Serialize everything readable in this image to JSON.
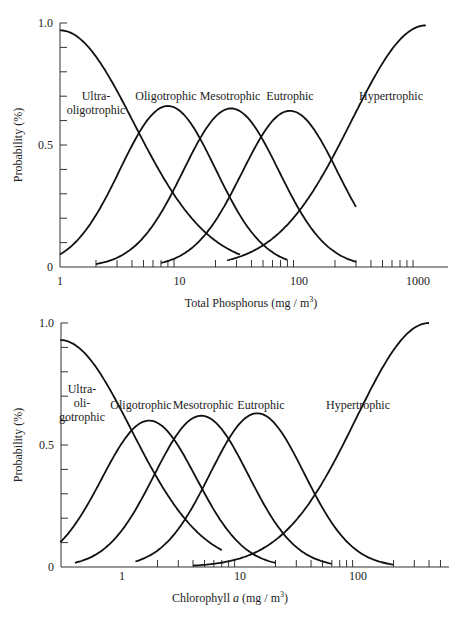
{
  "chart_data": [
    {
      "type": "line",
      "title": "",
      "xlabel": "Total Phosphorus (mg / m",
      "xlabel_sup": "3",
      "xlabel_end": ")",
      "ylabel": "Probability (%)",
      "xscale": "log",
      "xlim": [
        1,
        1800
      ],
      "ylim": [
        0,
        1.0
      ],
      "x_ticks": [
        "1",
        "10",
        "100",
        "1000"
      ],
      "y_ticks": [
        "0",
        "0.5",
        "1.0"
      ],
      "grid": false,
      "series": [
        {
          "name": "Ultra-oligotrophic",
          "label_lines": [
            "Ultra-",
            "oligotrophic"
          ],
          "kind": "left-tail",
          "center": 1.0,
          "peak": 0.97,
          "width": 0.62,
          "x_end": 32
        },
        {
          "name": "Oligotrophic",
          "label_lines": [
            "Oligotrophic"
          ],
          "kind": "gauss",
          "center": 8,
          "peak": 0.66,
          "width": 0.4,
          "x_start": 1,
          "x_end": 80
        },
        {
          "name": "Mesotrophic",
          "label_lines": [
            "Mesotrophic"
          ],
          "kind": "gauss",
          "center": 27,
          "peak": 0.65,
          "width": 0.4,
          "x_start": 2,
          "x_end": 300
        },
        {
          "name": "Eutrophic",
          "label_lines": [
            "Eutrophic"
          ],
          "kind": "gauss",
          "center": 84,
          "peak": 0.64,
          "width": 0.4,
          "x_start": 7,
          "x_end": 300
        },
        {
          "name": "Hypertrophic",
          "label_lines": [
            "Hypertrophic"
          ],
          "kind": "right-tail",
          "center": 1150,
          "peak": 0.99,
          "width": 0.62,
          "x_start": 25,
          "x_end": 1150
        }
      ],
      "approx_points": {
        "Ultra-oligotrophic": [
          [
            1,
            0.97
          ],
          [
            3,
            0.78
          ],
          [
            5,
            0.5
          ],
          [
            10,
            0.15
          ],
          [
            20,
            0.02
          ]
        ],
        "Oligotrophic": [
          [
            1,
            0.03
          ],
          [
            4,
            0.4
          ],
          [
            8,
            0.66
          ],
          [
            15,
            0.4
          ],
          [
            40,
            0.02
          ]
        ],
        "Mesotrophic": [
          [
            4,
            0.03
          ],
          [
            14,
            0.4
          ],
          [
            27,
            0.65
          ],
          [
            50,
            0.4
          ],
          [
            150,
            0.02
          ]
        ],
        "Eutrophic": [
          [
            12,
            0.03
          ],
          [
            45,
            0.4
          ],
          [
            84,
            0.64
          ],
          [
            160,
            0.4
          ],
          [
            300,
            0.03
          ]
        ],
        "Hypertrophic": [
          [
            50,
            0.03
          ],
          [
            150,
            0.5
          ],
          [
            300,
            0.78
          ],
          [
            1150,
            0.99
          ]
        ]
      }
    },
    {
      "type": "line",
      "title": "",
      "xlabel": "Chlorophyll ",
      "xlabel_italic": "a",
      "xlabel_rest": " (mg / m",
      "xlabel_sup": "3",
      "xlabel_end": ")",
      "ylabel": "Probability (%)",
      "xscale": "log",
      "xlim": [
        0.3,
        620
      ],
      "ylim": [
        0,
        1.0
      ],
      "x_ticks": [
        "1",
        "10",
        "100"
      ],
      "y_ticks": [
        "0",
        "0.5",
        "1.0"
      ],
      "grid": false,
      "series": [
        {
          "name": "Ultra-oligotrophic",
          "label_lines": [
            "Ultra-",
            "oli-",
            "gotrophic"
          ],
          "kind": "left-tail",
          "center": 0.3,
          "peak": 0.93,
          "width": 0.6,
          "x_end": 7
        },
        {
          "name": "Oligotrophic",
          "label_lines": [
            "Oligotrophic"
          ],
          "kind": "gauss",
          "center": 1.7,
          "peak": 0.6,
          "width": 0.4,
          "x_start": 0.3,
          "x_end": 20
        },
        {
          "name": "Mesotrophic",
          "label_lines": [
            "Mesotrophic"
          ],
          "kind": "gauss",
          "center": 4.7,
          "peak": 0.62,
          "width": 0.4,
          "x_start": 0.4,
          "x_end": 60
        },
        {
          "name": "Eutrophic",
          "label_lines": [
            "Eutrophic"
          ],
          "kind": "gauss",
          "center": 14,
          "peak": 0.63,
          "width": 0.4,
          "x_start": 1.3,
          "x_end": 200
        },
        {
          "name": "Hypertrophic",
          "label_lines": [
            "Hypertrophic"
          ],
          "kind": "right-tail",
          "center": 400,
          "peak": 1.0,
          "width": 0.62,
          "x_start": 4,
          "x_end": 400
        }
      ],
      "approx_points": {
        "Ultra-oligotrophic": [
          [
            0.3,
            0.93
          ],
          [
            0.6,
            0.75
          ],
          [
            1.0,
            0.45
          ],
          [
            2,
            0.12
          ],
          [
            5,
            0.01
          ]
        ],
        "Oligotrophic": [
          [
            0.3,
            0.08
          ],
          [
            0.9,
            0.4
          ],
          [
            1.7,
            0.6
          ],
          [
            3.2,
            0.4
          ],
          [
            10,
            0.02
          ]
        ],
        "Mesotrophic": [
          [
            1.2,
            0.03
          ],
          [
            2.5,
            0.4
          ],
          [
            4.7,
            0.62
          ],
          [
            9,
            0.4
          ],
          [
            30,
            0.02
          ]
        ],
        "Eutrophic": [
          [
            3,
            0.03
          ],
          [
            8,
            0.4
          ],
          [
            14,
            0.63
          ],
          [
            27,
            0.4
          ],
          [
            100,
            0.02
          ]
        ],
        "Hypertrophic": [
          [
            10,
            0.05
          ],
          [
            30,
            0.5
          ],
          [
            60,
            0.8
          ],
          [
            400,
            1.0
          ]
        ]
      }
    }
  ]
}
